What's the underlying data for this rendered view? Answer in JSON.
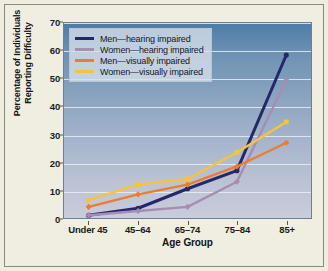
{
  "chart_data": {
    "type": "line",
    "title": "",
    "xlabel": "Age Group",
    "ylabel_line1": "Percentage of Individuals",
    "ylabel_line2": "Reporting Difficulty",
    "categories": [
      "Under 45",
      "45–64",
      "65–74",
      "75–84",
      "85+"
    ],
    "yticks": [
      0,
      10,
      20,
      30,
      40,
      50,
      60,
      70
    ],
    "ylim": [
      0,
      70
    ],
    "grid": true,
    "legend_position": "top-left",
    "series": [
      {
        "name": "Men—hearing impaired",
        "color": "#24286b",
        "values": [
          1,
          3.5,
          10.5,
          17,
          58.5
        ]
      },
      {
        "name": "Women—hearing impaired",
        "color": "#a98cb4",
        "values": [
          1,
          2.5,
          4,
          13,
          49.5
        ]
      },
      {
        "name": "Men—visually impaired",
        "color": "#ed7d2b",
        "values": [
          4,
          8.5,
          12,
          18.5,
          27
        ]
      },
      {
        "name": "Women—visually impaired",
        "color": "#f8c23d",
        "values": [
          6.5,
          12,
          14,
          23.5,
          34.5
        ]
      }
    ]
  }
}
